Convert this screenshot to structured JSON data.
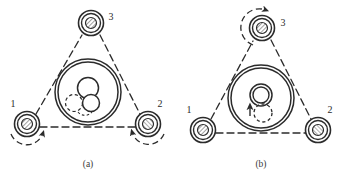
{
  "figure": {
    "type": "technical-diagram",
    "background_color": "#ffffff",
    "line_color": "#2b2b2b",
    "hatch_color": "#6e6e6e",
    "panels": [
      {
        "id": "a",
        "caption": "(a)",
        "rollers": [
          {
            "label": "1",
            "position": "lower-left",
            "cx": 27,
            "cy": 124,
            "r_outer": 12.5,
            "r_mid": 9.5,
            "r_hub": 5.5,
            "hub_fill": "hatched",
            "arc_arrow": true,
            "arc_direction": "clockwise"
          },
          {
            "label": "2",
            "position": "lower-right",
            "cx": 148,
            "cy": 124,
            "r_outer": 12.5,
            "r_mid": 9.5,
            "r_hub": 5.5,
            "hub_fill": "open",
            "arc_arrow": true,
            "arc_direction": "counterclockwise"
          },
          {
            "label": "3",
            "position": "top",
            "cx": 91,
            "cy": 23,
            "r_outer": 12.5,
            "r_mid": 9.5,
            "r_hub": 5.5,
            "hub_fill": "hatched",
            "arc_arrow": false,
            "arc_direction": ""
          }
        ],
        "ring": {
          "cx": 88,
          "cy": 92,
          "r_outer": 33,
          "r_inner": 30
        },
        "inner_parts": [
          {
            "kind": "solid-circle",
            "cx": 88,
            "cy": 88,
            "r": 10.5
          },
          {
            "kind": "solid-circle",
            "cx": 91,
            "cy": 103,
            "r": 8.5
          },
          {
            "kind": "dashed-circle",
            "cx": 74,
            "cy": 103,
            "r": 8.5
          }
        ],
        "label_positions": [
          {
            "text": "1",
            "x": 13,
            "y": 107
          },
          {
            "text": "2",
            "x": 160,
            "y": 107
          },
          {
            "text": "3",
            "x": 111,
            "y": 20
          }
        ],
        "caption_x": 88,
        "caption_y": 167
      },
      {
        "id": "b",
        "caption": "(b)",
        "rollers": [
          {
            "label": "1",
            "position": "lower-left",
            "cx": 203,
            "cy": 130,
            "r_outer": 12.5,
            "r_mid": 9.5,
            "r_hub": 5.5,
            "hub_fill": "hatched",
            "arc_arrow": false,
            "arc_direction": ""
          },
          {
            "label": "2",
            "position": "lower-right",
            "cx": 318,
            "cy": 130,
            "r_outer": 12.5,
            "r_mid": 9.5,
            "r_hub": 5.5,
            "hub_fill": "hatched",
            "arc_arrow": false,
            "arc_direction": ""
          },
          {
            "label": "3",
            "position": "top",
            "cx": 262,
            "cy": 28,
            "r_outer": 12.5,
            "r_mid": 9.5,
            "r_hub": 5.5,
            "hub_fill": "hatched",
            "arc_arrow": true,
            "arc_direction": "counterclockwise"
          }
        ],
        "ring": {
          "cx": 261,
          "cy": 98,
          "r_outer": 33,
          "r_inner": 30
        },
        "inner_parts": [
          {
            "kind": "ring-circle",
            "cx": 261,
            "cy": 95,
            "r_outer": 11,
            "r_inner": 8
          },
          {
            "kind": "dashed-circle",
            "cx": 263,
            "cy": 113,
            "r": 9
          },
          {
            "kind": "up-arrow",
            "x": 250,
            "y": 112,
            "length": 10
          }
        ],
        "label_positions": [
          {
            "text": "1",
            "x": 189,
            "y": 113
          },
          {
            "text": "2",
            "x": 330,
            "y": 113
          },
          {
            "text": "3",
            "x": 283,
            "y": 26
          }
        ],
        "caption_x": 261,
        "caption_y": 167
      }
    ]
  }
}
